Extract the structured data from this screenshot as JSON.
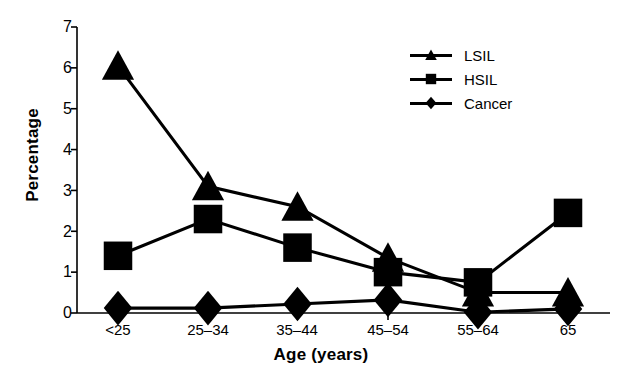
{
  "chart_data": {
    "type": "line",
    "title": "",
    "subtitle": "",
    "xlabel": "Age (years)",
    "ylabel": "Percentage",
    "categories": [
      "<25",
      "25–34",
      "35–44",
      "45–54",
      "55–64",
      "65"
    ],
    "series": [
      {
        "name": "LSIL",
        "marker": "triangle",
        "values": [
          6.05,
          3.1,
          2.6,
          1.35,
          0.5,
          0.5
        ]
      },
      {
        "name": "HSIL",
        "marker": "square",
        "values": [
          1.4,
          2.3,
          1.6,
          1.0,
          0.75,
          2.45
        ]
      },
      {
        "name": "Cancer",
        "marker": "diamond",
        "values": [
          0.12,
          0.12,
          0.22,
          0.32,
          0.02,
          0.1
        ]
      }
    ],
    "ylim": [
      0,
      7
    ],
    "yticks": [
      0,
      1,
      2,
      3,
      4,
      5,
      6,
      7
    ],
    "ytick_labels": [
      "0",
      "1",
      "2",
      "3",
      "4",
      "5",
      "6",
      "7"
    ],
    "grid": false,
    "legend_position": "upper-right-inside",
    "line_color": "#000000",
    "axis_color": "#000000",
    "background_color": "#ffffff"
  },
  "legend": {
    "entries": [
      {
        "label": "LSIL"
      },
      {
        "label": "HSIL"
      },
      {
        "label": "Cancer"
      }
    ]
  },
  "axes": {
    "y_title": "Percentage",
    "x_title": "Age (years)"
  }
}
